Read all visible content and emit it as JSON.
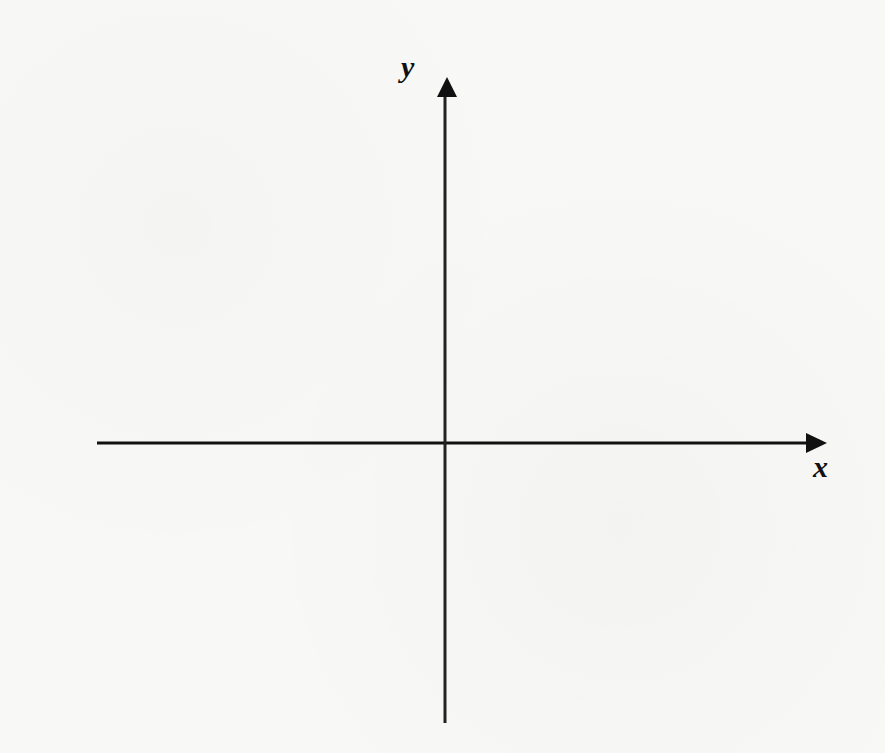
{
  "diagram": {
    "type": "cartesian-axes",
    "axes": {
      "x": {
        "label": "x",
        "direction": "right"
      },
      "y": {
        "label": "y",
        "direction": "up"
      }
    },
    "colors": {
      "background": "#f8f8f6",
      "axis": "#111111",
      "label": "#111111"
    }
  }
}
